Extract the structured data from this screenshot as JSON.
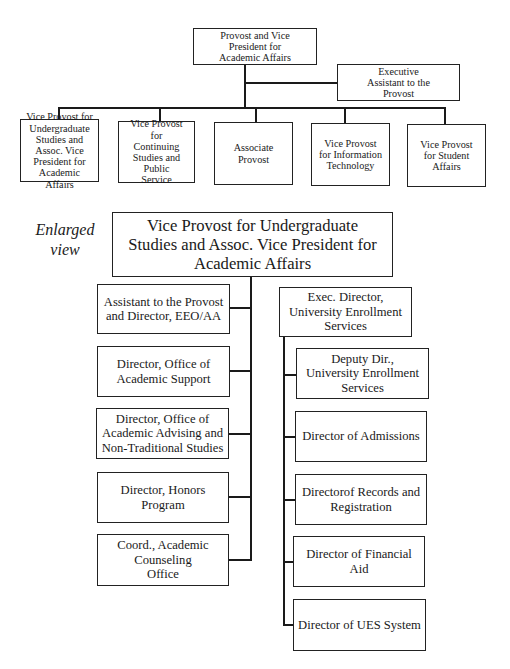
{
  "top_chart": {
    "root": {
      "label": "Provost and Vice President for Academic Affairs"
    },
    "assistant": {
      "label": "Executive Assistant to the Provost"
    },
    "children": [
      {
        "label": "Vice Provost for Undergraduate Studies and Assoc. Vice President for Academic Affairs"
      },
      {
        "label": "Vice Provost for Continuing Studies and Public Service"
      },
      {
        "label": "Associate Provost"
      },
      {
        "label": "Vice Provost for Information Technology"
      },
      {
        "label": "Vice Provost for Student Affairs"
      }
    ]
  },
  "enlarged": {
    "caption_line1": "Enlarged",
    "caption_line2": "view",
    "root": {
      "label": "Vice Provost for Undergraduate Studies and Assoc. Vice President for Academic Affairs"
    },
    "left_children": [
      {
        "label": "Assistant to the Provost and Director, EEO/AA"
      },
      {
        "label": "Director, Office of Academic Support"
      },
      {
        "label": "Director, Office of Academic Advising and Non-Traditional Studies"
      },
      {
        "label": "Director, Honors Program"
      },
      {
        "label": "Coord., Academic Counseling Office"
      }
    ],
    "right_head": {
      "label": "Exec. Director, University Enrollment Services"
    },
    "right_children": [
      {
        "label": "Deputy Dir., University Enrollment Services"
      },
      {
        "label": "Director of Admissions"
      },
      {
        "label": "Directorof Records and Registration"
      },
      {
        "label": "Director of Financial Aid"
      },
      {
        "label": "Director of UES System"
      }
    ]
  }
}
